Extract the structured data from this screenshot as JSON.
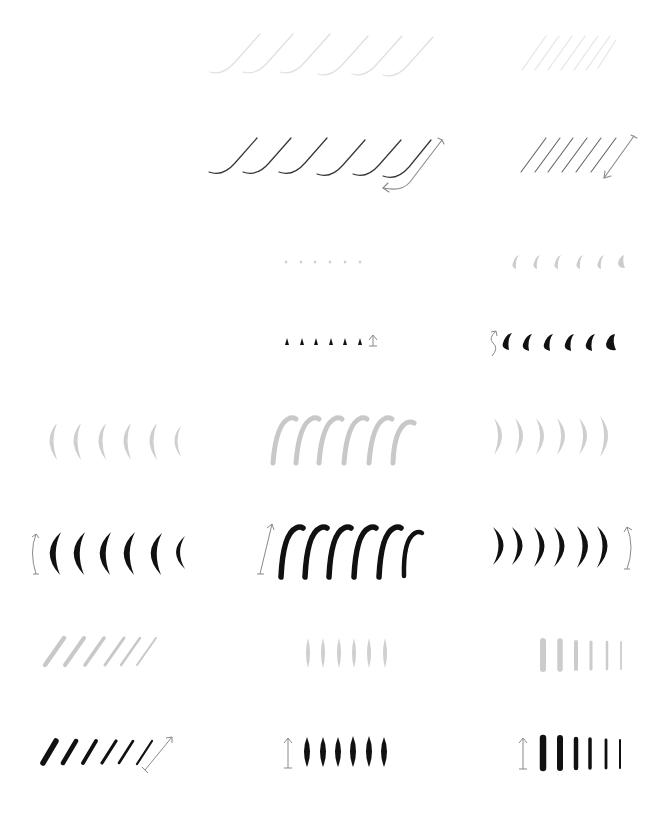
{
  "sheet": {
    "title": "",
    "colors": {
      "background": "#ffffff",
      "trace_gray": "#c8c8c8",
      "trace_light": "#e2e2e2",
      "ink": "#111111",
      "arrow": "#8a8a8a"
    },
    "layout": {
      "columns": 3,
      "rows": 8,
      "width": 668,
      "height": 819
    },
    "drills": [
      {
        "id": "hairline-curve-trace",
        "row": 1,
        "col": 2,
        "style": "trace-light",
        "count": 6,
        "arrow": "none"
      },
      {
        "id": "hairline-diagonal-trace",
        "row": 1,
        "col": 3,
        "style": "trace-light",
        "count": 7,
        "arrow": "none"
      },
      {
        "id": "hairline-curve",
        "row": 2,
        "col": 2,
        "style": "ink",
        "count": 6,
        "arrow": "up-then-hook-left"
      },
      {
        "id": "hairline-diagonal",
        "row": 2,
        "col": 3,
        "style": "ink",
        "count": 7,
        "arrow": "down-left"
      },
      {
        "id": "dot-trace",
        "row": 3,
        "col": 2,
        "style": "trace",
        "count": 6,
        "arrow": "none"
      },
      {
        "id": "teardrop-trace",
        "row": 3,
        "col": 3,
        "style": "trace",
        "count": 6,
        "arrow": "none"
      },
      {
        "id": "dot",
        "row": 4,
        "col": 2,
        "style": "ink",
        "count": 6,
        "arrow": "up"
      },
      {
        "id": "teardrop",
        "row": 4,
        "col": 3,
        "style": "ink",
        "count": 6,
        "arrow": "curved"
      },
      {
        "id": "left-crescent-trace",
        "row": 5,
        "col": 1,
        "style": "trace",
        "count": 6,
        "arrow": "none"
      },
      {
        "id": "f-stroke-trace",
        "row": 5,
        "col": 2,
        "style": "trace",
        "count": 6,
        "arrow": "none"
      },
      {
        "id": "right-crescent-trace",
        "row": 5,
        "col": 3,
        "style": "trace",
        "count": 6,
        "arrow": "none"
      },
      {
        "id": "left-crescent",
        "row": 6,
        "col": 1,
        "style": "ink",
        "count": 6,
        "arrow": "curved-vertical"
      },
      {
        "id": "f-stroke",
        "row": 6,
        "col": 2,
        "style": "ink",
        "count": 6,
        "arrow": "up"
      },
      {
        "id": "right-crescent",
        "row": 6,
        "col": 3,
        "style": "ink",
        "count": 6,
        "arrow": "curved-vertical"
      },
      {
        "id": "diagonal-trace",
        "row": 7,
        "col": 1,
        "style": "trace",
        "count": 6,
        "arrow": "none"
      },
      {
        "id": "lens-trace",
        "row": 7,
        "col": 2,
        "style": "trace",
        "count": 6,
        "arrow": "none"
      },
      {
        "id": "vertical-bar-trace",
        "row": 7,
        "col": 3,
        "style": "trace",
        "count": 6,
        "arrow": "none"
      },
      {
        "id": "diagonal",
        "row": 8,
        "col": 1,
        "style": "ink",
        "count": 6,
        "arrow": "up-right"
      },
      {
        "id": "lens",
        "row": 8,
        "col": 2,
        "style": "ink",
        "count": 6,
        "arrow": "up"
      },
      {
        "id": "vertical-bar",
        "row": 8,
        "col": 3,
        "style": "ink",
        "count": 6,
        "arrow": "up"
      }
    ]
  }
}
